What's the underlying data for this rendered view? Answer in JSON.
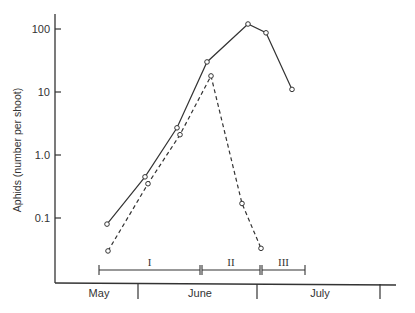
{
  "chart_data": {
    "type": "line",
    "title": "",
    "xlabel": "",
    "ylabel": "Aphids (number per shoot)",
    "yscale": "log",
    "ylim": [
      0.015,
      150
    ],
    "yticks": [
      {
        "value": 100,
        "label": "100"
      },
      {
        "value": 10,
        "label": "10"
      },
      {
        "value": 1,
        "label": "1.0"
      },
      {
        "value": 0.1,
        "label": "0.1"
      }
    ],
    "months": [
      "May",
      "June",
      "July"
    ],
    "grid": false,
    "legend": null,
    "series": [
      {
        "name": "solid",
        "style": "solid",
        "marker": "open-circle",
        "points": [
          {
            "x_px": 107,
            "value": 0.08
          },
          {
            "x_px": 145,
            "value": 0.45
          },
          {
            "x_px": 177,
            "value": 2.7
          },
          {
            "x_px": 207,
            "value": 30
          },
          {
            "x_px": 248,
            "value": 120
          },
          {
            "x_px": 266,
            "value": 87
          },
          {
            "x_px": 292,
            "value": 11
          }
        ]
      },
      {
        "name": "dashed",
        "style": "dashed",
        "marker": "open-circle",
        "points": [
          {
            "x_px": 108,
            "value": 0.03
          },
          {
            "x_px": 148,
            "value": 0.35
          },
          {
            "x_px": 180,
            "value": 2.1
          },
          {
            "x_px": 211,
            "value": 18
          },
          {
            "x_px": 242,
            "value": 0.17
          },
          {
            "x_px": 261,
            "value": 0.033
          }
        ]
      }
    ],
    "periods": [
      {
        "label": "I",
        "x_start_px": 99,
        "x_end_px": 200
      },
      {
        "label": "II",
        "x_start_px": 202,
        "x_end_px": 260
      },
      {
        "label": "III",
        "x_start_px": 262,
        "x_end_px": 305
      }
    ]
  }
}
